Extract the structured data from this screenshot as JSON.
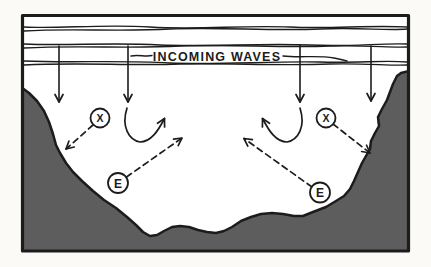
{
  "figure": {
    "caption": "INCOMING WAVES",
    "markers": {
      "x_left": "X",
      "x_right": "X",
      "e_left": "E",
      "e_right": "E"
    },
    "colors": {
      "ink": "#1c1c1c",
      "land": "#5d5d5d",
      "water": "#ffffff"
    }
  }
}
